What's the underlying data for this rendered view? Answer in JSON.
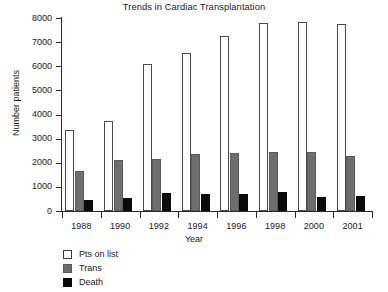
{
  "chart_data": {
    "type": "bar",
    "title": "Trends in Cardiac Transplantation",
    "xlabel": "Year",
    "ylabel": "Number patients",
    "categories": [
      "1988",
      "1990",
      "1992",
      "1994",
      "1996",
      "1998",
      "2000",
      "2001"
    ],
    "series": [
      {
        "name": "Pts on list",
        "color": "#ffffff",
        "values": [
          3350,
          3750,
          6080,
          6570,
          7250,
          7800,
          7820,
          7750
        ]
      },
      {
        "name": "Trans",
        "color": "#6e6e6e",
        "values": [
          1650,
          2110,
          2170,
          2380,
          2400,
          2430,
          2430,
          2300
        ]
      },
      {
        "name": "Death",
        "color": "#0b0b0b",
        "values": [
          440,
          560,
          760,
          690,
          710,
          790,
          580,
          640
        ]
      }
    ],
    "ylim": [
      0,
      8000
    ],
    "yticks": [
      0,
      1000,
      2000,
      3000,
      4000,
      5000,
      6000,
      7000,
      8000
    ],
    "ytick_labels": [
      "0",
      "1000",
      "2000",
      "3000",
      "4000",
      "5000",
      "6000",
      "7000",
      "8000"
    ],
    "grid": false,
    "legend_position": "below-left",
    "legend": [
      "Pts on list",
      "Trans",
      "Death"
    ]
  }
}
